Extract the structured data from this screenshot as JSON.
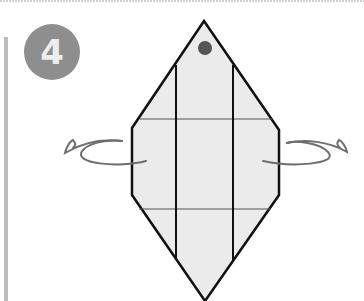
{
  "step": {
    "number": "4",
    "badge_color": "#8e8e8e",
    "number_color": "#ededed"
  },
  "diagram": {
    "fill_color": "#ebebeb",
    "outline_color": "#111111",
    "crease_color": "#555555",
    "arrow_color": "#6e6e6e",
    "marker_dot_color": "#555555",
    "arrows": [
      {
        "side": "left",
        "direction": "fold-behind"
      },
      {
        "side": "right",
        "direction": "fold-behind"
      }
    ]
  },
  "decor": {
    "side_bar_color": "#bdbdbd",
    "top_rule_color": "#cfcfcf"
  }
}
